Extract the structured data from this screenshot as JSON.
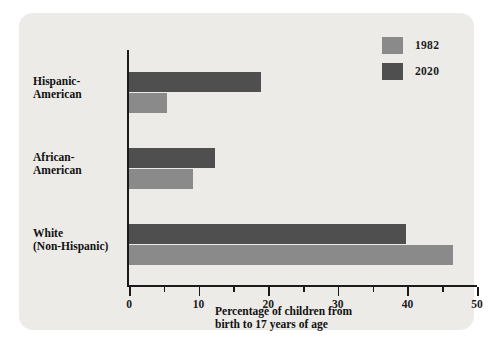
{
  "chart_data": {
    "type": "bar",
    "orientation": "horizontal",
    "title": "",
    "xlabel": "Percentage of children from birth to 17 years of age",
    "ylabel": "",
    "xlim": [
      0,
      50
    ],
    "grid": false,
    "legend_position": "top-right",
    "categories": [
      "Hispanic-American",
      "African-American",
      "White (Non-Hispanic)"
    ],
    "series": [
      {
        "name": "1982",
        "color": "#8a8a8a",
        "values": [
          5.5,
          9.2,
          46.5
        ]
      },
      {
        "name": "2020",
        "color": "#4f4f4f",
        "values": [
          19.0,
          12.3,
          39.8
        ]
      }
    ],
    "x_major_ticks": [
      0,
      10,
      20,
      30,
      40,
      50
    ],
    "x_minor_ticks": [
      5,
      15,
      25,
      35,
      45
    ],
    "x_tick_labels": [
      "0",
      "10",
      "20",
      "30",
      "40",
      "50"
    ]
  },
  "legend": {
    "items": [
      {
        "label": "1982",
        "color": "#8a8a8a"
      },
      {
        "label": "2020",
        "color": "#4f4f4f"
      }
    ]
  },
  "axis": {
    "title_line1": "Percentage of children from",
    "title_line2": "birth to 17 years of age"
  },
  "categories": [
    {
      "line1": "Hispanic-",
      "line2": "American"
    },
    {
      "line1": "African-",
      "line2": "American"
    },
    {
      "line1": "White",
      "line2": "(Non-Hispanic)"
    }
  ],
  "colors": {
    "series_1982": "#8a8a8a",
    "series_2020": "#4f4f4f",
    "panel_background": "#ecebe8",
    "axis": "#1a1a1a",
    "page_background": "#ffffff"
  }
}
